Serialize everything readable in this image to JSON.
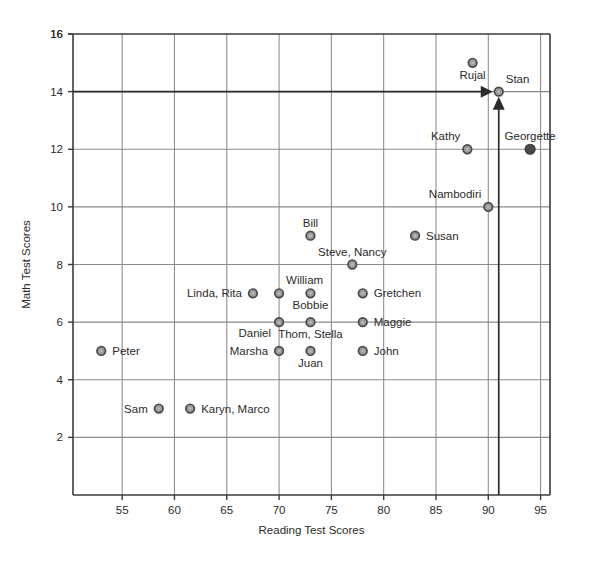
{
  "chart_data": {
    "type": "scatter",
    "title": "",
    "xlabel": "Reading Test Scores",
    "ylabel": "Math Test Scores",
    "xlim": [
      50.3,
      95.9
    ],
    "ylim": [
      0,
      16
    ],
    "xticks": [
      55,
      60,
      65,
      70,
      75,
      80,
      85,
      90,
      95
    ],
    "yticks": [
      2,
      4,
      6,
      8,
      10,
      12,
      14,
      16
    ],
    "grid": true,
    "legend": "none",
    "marker_default_color": "#9a9a9a",
    "marker_highlight_color": "#4a4a4a",
    "points": [
      {
        "label": "Peter",
        "x": 53,
        "y": 5,
        "label_pos": "right",
        "style": "open"
      },
      {
        "label": "Sam",
        "x": 58.5,
        "y": 3,
        "label_pos": "left",
        "style": "open"
      },
      {
        "label": "Karyn, Marco",
        "x": 61.5,
        "y": 3,
        "label_pos": "right",
        "style": "open"
      },
      {
        "label": "Linda, Rita",
        "x": 67.5,
        "y": 7,
        "label_pos": "left",
        "style": "open"
      },
      {
        "label": "William",
        "x": 70,
        "y": 7,
        "label_pos": "above-right",
        "style": "open"
      },
      {
        "label": "Daniel",
        "x": 70,
        "y": 6,
        "label_pos": "below-left",
        "style": "open"
      },
      {
        "label": "Marsha",
        "x": 70,
        "y": 5,
        "label_pos": "left",
        "style": "open"
      },
      {
        "label": "Bill",
        "x": 73,
        "y": 9,
        "label_pos": "above",
        "style": "open"
      },
      {
        "label": "Bobbie",
        "x": 73,
        "y": 7,
        "label_pos": "below",
        "style": "open"
      },
      {
        "label": "Thom, Stella",
        "x": 73,
        "y": 6,
        "label_pos": "below",
        "style": "open"
      },
      {
        "label": "Juan",
        "x": 73,
        "y": 5,
        "label_pos": "below",
        "style": "open"
      },
      {
        "label": "Steve, Nancy",
        "x": 77,
        "y": 8,
        "label_pos": "above",
        "style": "open"
      },
      {
        "label": "Gretchen",
        "x": 78,
        "y": 7,
        "label_pos": "right",
        "style": "open"
      },
      {
        "label": "Maggie",
        "x": 78,
        "y": 6,
        "label_pos": "right",
        "style": "open"
      },
      {
        "label": "John",
        "x": 78,
        "y": 5,
        "label_pos": "right",
        "style": "open"
      },
      {
        "label": "Susan",
        "x": 83,
        "y": 9,
        "label_pos": "right",
        "style": "open"
      },
      {
        "label": "Kathy",
        "x": 88,
        "y": 12,
        "label_pos": "above-left",
        "style": "open"
      },
      {
        "label": "Rujal",
        "x": 88.5,
        "y": 15,
        "label_pos": "below",
        "style": "open"
      },
      {
        "label": "Nambodiri",
        "x": 90,
        "y": 10,
        "label_pos": "above-left",
        "style": "open"
      },
      {
        "label": "Stan",
        "x": 91,
        "y": 14,
        "label_pos": "above-right",
        "style": "open"
      },
      {
        "label": "Georgette",
        "x": 94,
        "y": 12,
        "label_pos": "above",
        "style": "solid"
      }
    ],
    "annotations": [
      {
        "name": "horizontal-arrow-to-stan",
        "type": "arrow",
        "from_x": 50.3,
        "from_y": 14,
        "to_x": 91,
        "to_y": 14
      },
      {
        "name": "vertical-arrow-to-stan",
        "type": "arrow",
        "from_x": 91,
        "from_y": 0,
        "to_x": 91,
        "to_y": 14
      }
    ]
  }
}
